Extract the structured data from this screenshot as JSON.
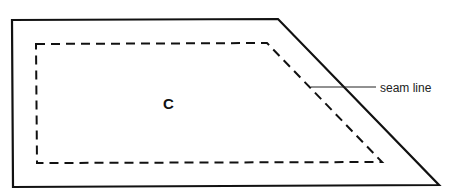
{
  "diagram": {
    "piece_label": "C",
    "callout_label": "seam line",
    "colors": {
      "line": "#111111",
      "background": "#ffffff"
    },
    "outer_edge": [
      [
        12,
        20
      ],
      [
        278,
        19
      ],
      [
        439,
        185
      ],
      [
        13,
        187
      ]
    ],
    "seam_line": [
      [
        36,
        44
      ],
      [
        267,
        43
      ],
      [
        382,
        162
      ],
      [
        37,
        163
      ]
    ],
    "leader": [
      [
        311,
        87
      ],
      [
        376,
        87
      ]
    ]
  }
}
